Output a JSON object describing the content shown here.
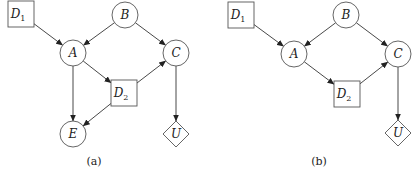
{
  "figure": {
    "panels": [
      {
        "id": "a",
        "caption": "(a)",
        "caption_pos": [
          94,
          165
        ],
        "nodes": [
          {
            "id": "D1",
            "label": "D",
            "sub": "1",
            "shape": "square",
            "cx": 21,
            "cy": 14
          },
          {
            "id": "B",
            "label": "B",
            "sub": "",
            "shape": "circle",
            "cx": 125,
            "cy": 15
          },
          {
            "id": "A",
            "label": "A",
            "sub": "",
            "shape": "circle",
            "cx": 73,
            "cy": 53
          },
          {
            "id": "C",
            "label": "C",
            "sub": "",
            "shape": "circle",
            "cx": 176,
            "cy": 53
          },
          {
            "id": "D2",
            "label": "D",
            "sub": "2",
            "shape": "square",
            "cx": 124,
            "cy": 93
          },
          {
            "id": "E",
            "label": "E",
            "sub": "",
            "shape": "circle",
            "cx": 73,
            "cy": 134
          },
          {
            "id": "U",
            "label": "U",
            "sub": "",
            "shape": "diamond",
            "cx": 176,
            "cy": 134
          }
        ],
        "edges": [
          [
            "D1",
            "A"
          ],
          [
            "B",
            "A"
          ],
          [
            "B",
            "C"
          ],
          [
            "A",
            "D2"
          ],
          [
            "A",
            "E"
          ],
          [
            "D2",
            "C"
          ],
          [
            "D2",
            "E"
          ],
          [
            "C",
            "U"
          ]
        ]
      },
      {
        "id": "b",
        "caption": "(b)",
        "caption_pos": [
          319,
          165
        ],
        "nodes": [
          {
            "id": "D1",
            "label": "D",
            "sub": "1",
            "shape": "square",
            "cx": 241,
            "cy": 15
          },
          {
            "id": "B",
            "label": "B",
            "sub": "",
            "shape": "circle",
            "cx": 346,
            "cy": 15
          },
          {
            "id": "A",
            "label": "A",
            "sub": "",
            "shape": "circle",
            "cx": 294,
            "cy": 54
          },
          {
            "id": "C",
            "label": "C",
            "sub": "",
            "shape": "circle",
            "cx": 398,
            "cy": 54
          },
          {
            "id": "D2",
            "label": "D",
            "sub": "2",
            "shape": "square",
            "cx": 347,
            "cy": 94
          },
          {
            "id": "U",
            "label": "U",
            "sub": "",
            "shape": "diamond",
            "cx": 398,
            "cy": 133
          }
        ],
        "edges": [
          [
            "D1",
            "A"
          ],
          [
            "B",
            "A"
          ],
          [
            "B",
            "C"
          ],
          [
            "A",
            "D2"
          ],
          [
            "D2",
            "C"
          ],
          [
            "C",
            "U"
          ]
        ]
      }
    ],
    "style": {
      "circle_r": 13,
      "square_half": 13,
      "diamond_half": 13,
      "stroke": "#555555",
      "edge_color": "#333333",
      "background": "#ffffff"
    }
  }
}
